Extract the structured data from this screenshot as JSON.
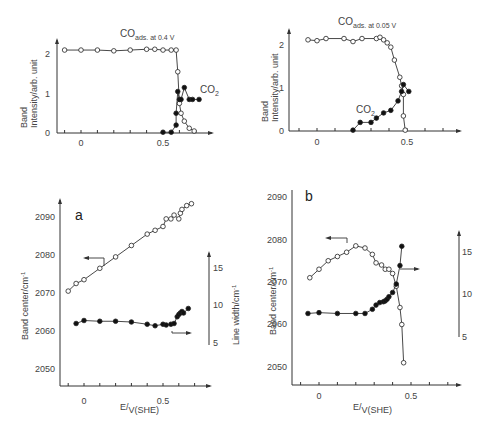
{
  "chart_data": [
    {
      "id": "top-left",
      "type": "line",
      "title": "CO ads. at 0.4 V",
      "xlabel": "",
      "ylabel": "Band intensity / arb. unit",
      "xticks": [
        "0",
        "0.5"
      ],
      "yticks": [
        "0",
        "1",
        "2"
      ],
      "xlim": [
        -0.15,
        0.8
      ],
      "ylim": [
        0,
        2.3
      ],
      "series": [
        {
          "name": "CO ads",
          "marker": "open",
          "x": [
            -0.1,
            0.0,
            0.1,
            0.2,
            0.3,
            0.4,
            0.45,
            0.5,
            0.55,
            0.58,
            0.59,
            0.6,
            0.61,
            0.63,
            0.66,
            0.69
          ],
          "y": [
            2.1,
            2.1,
            2.1,
            2.08,
            2.1,
            2.12,
            2.12,
            2.1,
            2.1,
            2.1,
            1.55,
            0.75,
            0.5,
            0.3,
            0.12,
            0.05
          ]
        },
        {
          "name": "CO2",
          "marker": "filled",
          "x": [
            0.5,
            0.55,
            0.58,
            0.58,
            0.59,
            0.6,
            0.61,
            0.63,
            0.66,
            0.68,
            0.72
          ],
          "y": [
            0.02,
            0.02,
            0.2,
            0.5,
            1.05,
            0.85,
            0.85,
            1.15,
            0.85,
            0.85,
            0.85
          ]
        }
      ],
      "annotations": [
        "CO2"
      ]
    },
    {
      "id": "top-right",
      "type": "line",
      "title": "CO ads. at 0.05 V",
      "xlabel": "",
      "ylabel": "Band intensity / arb. unit",
      "xticks": [
        "0",
        "0.5"
      ],
      "yticks": [
        "0",
        "1",
        "2"
      ],
      "xlim": [
        -0.15,
        0.8
      ],
      "ylim": [
        0,
        2.3
      ],
      "series": [
        {
          "name": "CO ads",
          "marker": "open",
          "x": [
            -0.05,
            0.0,
            0.05,
            0.15,
            0.2,
            0.25,
            0.33,
            0.35,
            0.37,
            0.39,
            0.41,
            0.43,
            0.46,
            0.47,
            0.48,
            0.48,
            0.49
          ],
          "y": [
            2.12,
            2.1,
            2.15,
            2.15,
            2.08,
            2.15,
            2.15,
            2.18,
            2.12,
            2.05,
            1.95,
            1.65,
            1.25,
            1.05,
            0.85,
            0.35,
            0.02
          ]
        },
        {
          "name": "CO2",
          "marker": "filled",
          "x": [
            0.2,
            0.24,
            0.3,
            0.33,
            0.37,
            0.41,
            0.45,
            0.47,
            0.48,
            0.51
          ],
          "y": [
            0.02,
            0.2,
            0.2,
            0.3,
            0.42,
            0.48,
            0.7,
            0.92,
            1.08,
            0.92
          ]
        }
      ],
      "annotations": [
        "CO2"
      ]
    },
    {
      "id": "bottom-left",
      "label": "a",
      "type": "line",
      "xlabel": "E / V(SHE)",
      "ylabel": "Band center / cm-1",
      "y2label": "Line width / cm-1",
      "xticks": [
        "0",
        "0.5"
      ],
      "yticks": [
        "2050",
        "2060",
        "2070",
        "2080",
        "2090"
      ],
      "y2ticks": [
        "5",
        "10",
        "15"
      ],
      "xlim": [
        -0.15,
        0.8
      ],
      "ylim": [
        2045,
        2095
      ],
      "y2lim": [
        4,
        18
      ],
      "series": [
        {
          "name": "Band center",
          "marker": "open",
          "axis": "left",
          "x": [
            -0.1,
            -0.05,
            0.0,
            0.1,
            0.2,
            0.3,
            0.4,
            0.45,
            0.5,
            0.52,
            0.55,
            0.57,
            0.6,
            0.61,
            0.62,
            0.65,
            0.68
          ],
          "y": [
            2070.5,
            2072.5,
            2073.5,
            2076.5,
            2079.5,
            2082.5,
            2085.5,
            2086.5,
            2087.5,
            2089.5,
            2089.5,
            2090.5,
            2089.5,
            2091,
            2092,
            2093,
            2093.5
          ]
        },
        {
          "name": "Line width",
          "marker": "filled",
          "axis": "right",
          "x": [
            -0.05,
            0.0,
            0.1,
            0.2,
            0.3,
            0.4,
            0.45,
            0.5,
            0.52,
            0.55,
            0.57,
            0.59,
            0.6,
            0.61,
            0.62,
            0.63,
            0.66
          ],
          "y": [
            7.6,
            8.0,
            7.9,
            7.9,
            7.8,
            7.5,
            7.3,
            7.5,
            7.4,
            7.5,
            7.6,
            8.5,
            8.8,
            9.0,
            9.2,
            9.0,
            9.6
          ]
        }
      ]
    },
    {
      "id": "bottom-right",
      "label": "b",
      "type": "line",
      "xlabel": "E / V(SHE)",
      "ylabel": "Band center / cm-1",
      "y2label": "",
      "xticks": [
        "0",
        "0.5"
      ],
      "yticks": [
        "2050",
        "2060",
        "2070",
        "2080",
        "2090"
      ],
      "y2ticks": [
        "5",
        "10",
        "15"
      ],
      "xlim": [
        -0.15,
        0.8
      ],
      "ylim": [
        2045,
        2092
      ],
      "y2lim": [
        4,
        18
      ],
      "series": [
        {
          "name": "Band center",
          "marker": "open",
          "axis": "left",
          "x": [
            -0.05,
            0.0,
            0.05,
            0.1,
            0.15,
            0.2,
            0.25,
            0.29,
            0.31,
            0.34,
            0.36,
            0.38,
            0.4,
            0.42,
            0.44,
            0.45,
            0.46
          ],
          "y": [
            2071,
            2073,
            2075,
            2076,
            2077,
            2078.5,
            2078,
            2076.5,
            2074.5,
            2074,
            2073,
            2073,
            2072,
            2069,
            2064,
            2060,
            2051
          ]
        },
        {
          "name": "Line width",
          "marker": "filled",
          "axis": "right",
          "x": [
            -0.06,
            0.0,
            0.1,
            0.2,
            0.25,
            0.29,
            0.31,
            0.33,
            0.35,
            0.36,
            0.37,
            0.38,
            0.4,
            0.42,
            0.44,
            0.45
          ],
          "y": [
            7.8,
            7.9,
            7.8,
            7.8,
            7.8,
            8.3,
            8.8,
            9.1,
            9.2,
            9.3,
            9.5,
            9.8,
            10.3,
            11.3,
            13.5,
            15.8
          ]
        }
      ]
    }
  ],
  "labels": {
    "tl_title": "CO",
    "tl_title_sub": "ads. at 0.4  V",
    "tr_title": "CO",
    "tr_title_sub": "ads. at  0.05 V",
    "co2": "CO",
    "co2_sub": "2",
    "band_intensity_1": "Band",
    "band_intensity_2": "Intensity/",
    "band_intensity_3": "arb. unit",
    "band_center": "Band center",
    "band_center_unit": "cm",
    "line_width": "Line width",
    "xlabel_e": "E",
    "xlabel_v": "V(SHE)",
    "panel_a": "a",
    "panel_b": "b"
  }
}
